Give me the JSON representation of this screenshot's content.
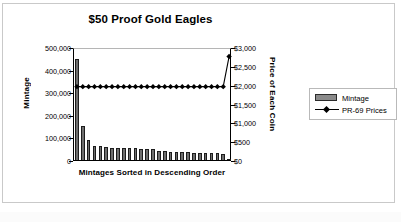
{
  "chart_data": {
    "type": "bar",
    "title": "$50 Proof Gold Eagles",
    "xlabel": "Mintages Sorted in Descending Order",
    "ylabel": "Mintage",
    "y2label": "Price of Each Coin",
    "grid": false,
    "legend_position": "right",
    "ylim": [
      0,
      500000
    ],
    "y2lim": [
      0,
      3000
    ],
    "ytick_labels": [
      "500,000",
      "400,000",
      "300,000",
      "200,000",
      "100,000",
      "0"
    ],
    "ytick_values": [
      500000,
      400000,
      300000,
      200000,
      100000,
      0
    ],
    "y2tick_labels": [
      "$3,000",
      "$2,500",
      "$2,000",
      "$1,500",
      "$1,000",
      "$500",
      "$0"
    ],
    "y2tick_values": [
      3000,
      2500,
      2000,
      1500,
      1000,
      500,
      0
    ],
    "categories": [
      "1",
      "2",
      "3",
      "4",
      "5",
      "6",
      "7",
      "8",
      "9",
      "10",
      "11",
      "12",
      "13",
      "14",
      "15",
      "16",
      "17",
      "18",
      "19",
      "20",
      "21",
      "22",
      "23",
      "24",
      "25",
      "26",
      "27"
    ],
    "series": [
      {
        "name": "Mintage",
        "type": "bar",
        "axis": "left",
        "color": "#6e6e6e",
        "values": [
          446000,
          150000,
          88000,
          62000,
          62000,
          58000,
          55000,
          54000,
          53000,
          52000,
          51000,
          50000,
          49000,
          48000,
          40000,
          38000,
          37000,
          36000,
          35000,
          34000,
          33000,
          32000,
          31000,
          30000,
          29000,
          28000,
          6000
        ]
      },
      {
        "name": "PR-69 Prices",
        "type": "line",
        "axis": "right",
        "color": "#000000",
        "marker": "diamond",
        "values": [
          2000,
          2000,
          2000,
          2000,
          2000,
          2000,
          2000,
          2000,
          2000,
          2000,
          2000,
          2000,
          2000,
          2000,
          2000,
          2000,
          2000,
          2000,
          2000,
          2000,
          2000,
          2000,
          2000,
          2000,
          2000,
          2000,
          2800
        ]
      }
    ]
  },
  "legend": {
    "items": [
      {
        "label": "Mintage",
        "key": "bar-swatch"
      },
      {
        "label": "PR-69 Prices",
        "key": "line-marker"
      }
    ]
  }
}
